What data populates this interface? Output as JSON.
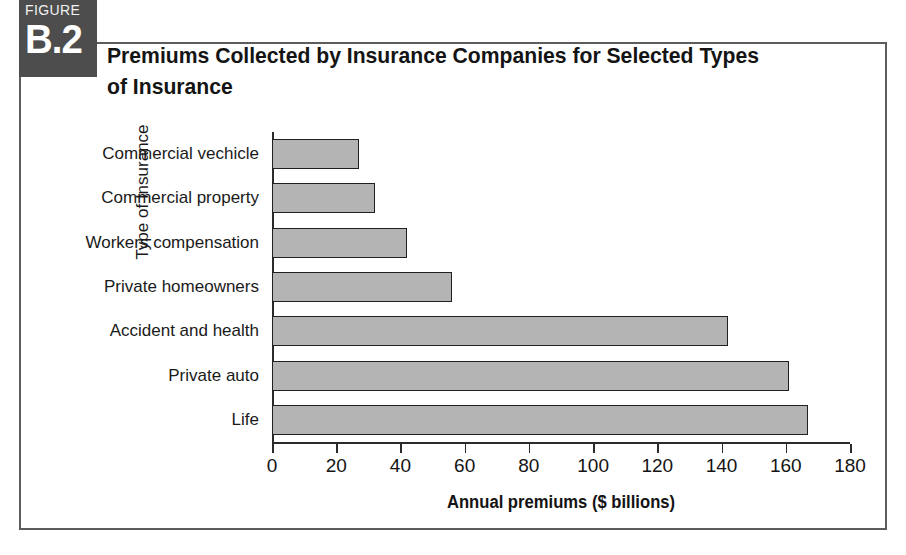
{
  "figure": {
    "badge_kicker": "FIGURE",
    "badge_number": "B.2",
    "title": "Premiums Collected by Insurance Companies for Selected Types of Insurance"
  },
  "colors": {
    "bar_fill": "#b4b4b4",
    "bar_border": "#1f1f1f",
    "badge_bg": "#4d4d4d",
    "frame": "#5c5c5c",
    "axis": "#2b2b2b"
  },
  "chart_data": {
    "type": "bar",
    "orientation": "horizontal",
    "title": "Premiums Collected by Insurance Companies for Selected Types of Insurance",
    "xlabel": "Annual premiums ($ billions)",
    "ylabel": "Type of Insurance",
    "xlim": [
      0,
      180
    ],
    "xticks": [
      0,
      20,
      40,
      60,
      80,
      100,
      120,
      140,
      160,
      180
    ],
    "xtick_labels": [
      "0",
      "20",
      "40",
      "60",
      "80",
      "100",
      "120",
      "140",
      "160",
      "180"
    ],
    "grid": false,
    "legend": false,
    "categories": [
      "Commercial vechicle",
      "Commercial property",
      "Workers compensation",
      "Private homeowners",
      "Accident and health",
      "Private auto",
      "Life"
    ],
    "values": [
      27,
      32,
      42,
      56,
      142,
      161,
      167
    ]
  }
}
